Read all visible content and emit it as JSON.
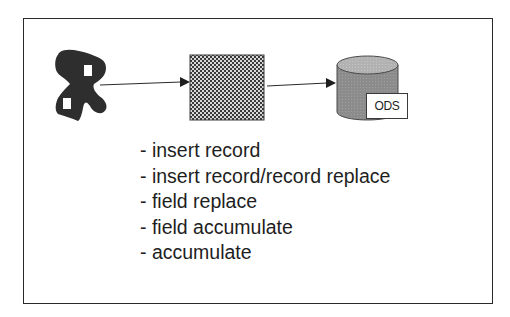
{
  "diagram": {
    "nodes": [
      {
        "id": "source",
        "icon": "scattered-data-icon",
        "label": ""
      },
      {
        "id": "transform",
        "icon": "checkerboard-process-icon",
        "label": ""
      },
      {
        "id": "store",
        "icon": "database-cylinder-icon",
        "label": "ODS"
      }
    ],
    "edges": [
      {
        "from": "source",
        "to": "transform"
      },
      {
        "from": "transform",
        "to": "store"
      }
    ],
    "ods_label": "ODS",
    "operations": [
      "- insert record",
      "- insert record/record replace",
      "- field replace",
      "- field accumulate",
      "- accumulate"
    ]
  },
  "colors": {
    "frame_border": "#2a2a2a",
    "text": "#1e1e1e",
    "source_shape": "#2e2e2e",
    "cylinder_body": "#8a8a8a",
    "cylinder_top": "#b4b4b4"
  }
}
